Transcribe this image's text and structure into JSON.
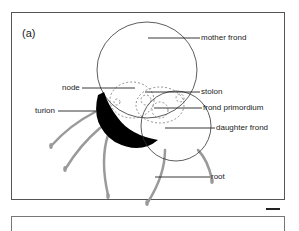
{
  "figure": {
    "panel_label": "(a)",
    "labels": {
      "mother_frond": "mother frond",
      "node": "node",
      "stolon": "stolon",
      "turion": "turion",
      "frond_primordium": "frond primordium",
      "daughter_frond": "daughter frond",
      "root": "root"
    },
    "colors": {
      "outline": "#333333",
      "turion_fill": "#000000",
      "root_stroke": "#9a9a9a",
      "frame": "#555555"
    },
    "scale_bar": "scale-bar"
  }
}
